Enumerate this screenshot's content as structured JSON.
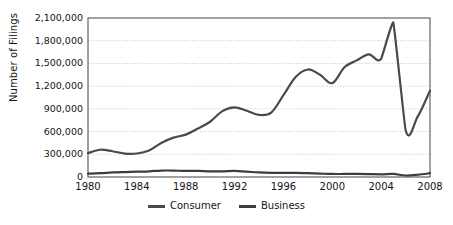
{
  "chart_data": {
    "type": "line",
    "title": "",
    "xlabel": "",
    "ylabel": "Number of Filings",
    "xlim": [
      1980,
      2008
    ],
    "ylim": [
      0,
      2100000
    ],
    "grid": true,
    "legend_position": "bottom",
    "x_ticks": [
      "1980",
      "1984",
      "1988",
      "1992",
      "1996",
      "2000",
      "2004",
      "2008"
    ],
    "y_ticks": [
      "0",
      "300,000",
      "600,000",
      "900,000",
      "1,200,000",
      "1,500,000",
      "1,800,000",
      "2,100,000"
    ],
    "y_tick_values": [
      0,
      300000,
      600000,
      900000,
      1200000,
      1500000,
      1800000,
      2100000
    ],
    "x": [
      1980,
      1981,
      1982,
      1983,
      1984,
      1985,
      1986,
      1987,
      1988,
      1989,
      1990,
      1991,
      1992,
      1993,
      1994,
      1995,
      1996,
      1997,
      1998,
      1999,
      2000,
      2001,
      2002,
      2003,
      2004,
      2005,
      2006,
      2007,
      2008
    ],
    "series": [
      {
        "name": "Consumer",
        "color": "#4a4a4a",
        "values": [
          315000,
          360000,
          340000,
          310000,
          310000,
          350000,
          450000,
          520000,
          560000,
          640000,
          730000,
          870000,
          920000,
          875000,
          820000,
          850000,
          1080000,
          1320000,
          1420000,
          1350000,
          1240000,
          1450000,
          1540000,
          1620000,
          1560000,
          2040000,
          620000,
          800000,
          1140000
        ]
      },
      {
        "name": "Business",
        "color": "#3d3d3d",
        "values": [
          45000,
          50000,
          60000,
          65000,
          70000,
          75000,
          85000,
          85000,
          80000,
          80000,
          75000,
          75000,
          80000,
          70000,
          60000,
          55000,
          55000,
          55000,
          50000,
          45000,
          40000,
          40000,
          40000,
          38000,
          35000,
          40000,
          20000,
          30000,
          50000
        ]
      }
    ]
  },
  "axes": {
    "y_title": "Number of Filings"
  },
  "legend": {
    "items": [
      {
        "label": "Consumer"
      },
      {
        "label": "Business"
      }
    ]
  },
  "colors": {
    "line": "#4a4a4a",
    "grid": "#b9b9b9",
    "frame": "#555555",
    "background": "#ffffff"
  }
}
